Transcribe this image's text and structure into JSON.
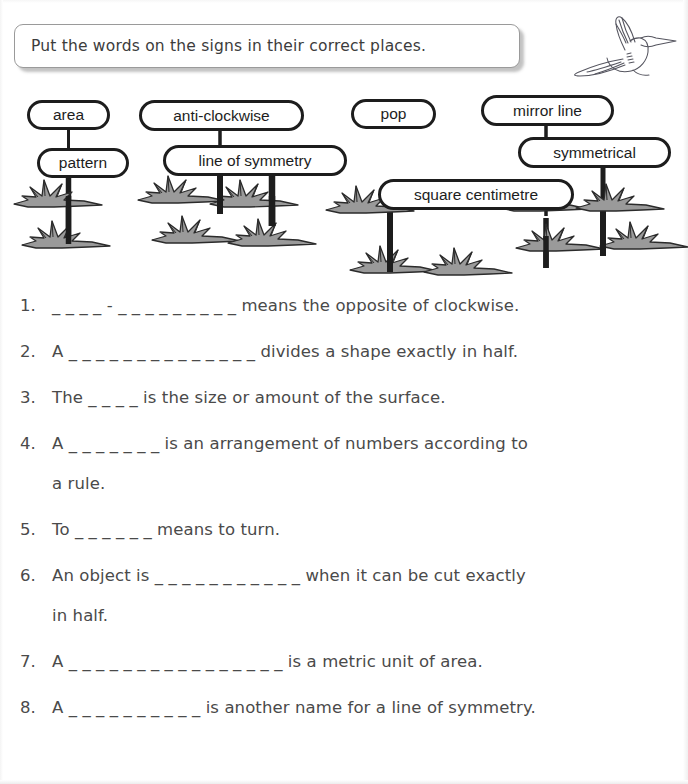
{
  "instruction": {
    "text": "Put the words on the signs in their correct places."
  },
  "decorations": {
    "bird_icon": "bird-flying-icon",
    "grass_icon": "grass-tuft-icon",
    "post_icon": "sign-post-icon"
  },
  "signs": [
    {
      "label": "area",
      "name": "sign-area"
    },
    {
      "label": "pattern",
      "name": "sign-pattern"
    },
    {
      "label": "anti-clockwise",
      "name": "sign-anti-clockwise"
    },
    {
      "label": "line of symmetry",
      "name": "sign-line-of-symmetry"
    },
    {
      "label": "pop",
      "name": "sign-pop"
    },
    {
      "label": "mirror line",
      "name": "sign-mirror-line"
    },
    {
      "label": "symmetrical",
      "name": "sign-symmetrical"
    },
    {
      "label": "square centimetre",
      "name": "sign-square-centimetre"
    }
  ],
  "questions": [
    {
      "number": "1.",
      "text": "_ _ _ _  -  _ _ _ _ _ _ _ _ _  means the opposite of clockwise.",
      "continuation": ""
    },
    {
      "number": "2.",
      "text": "A  _ _ _ _  _ _  _ _ _ _ _ _ _ _  divides a shape exactly in half.",
      "continuation": ""
    },
    {
      "number": "3.",
      "text": "The  _ _ _ _  is the size or amount of the surface.",
      "continuation": ""
    },
    {
      "number": "4.",
      "text": "A  _ _ _ _ _ _ _  is an arrangement of numbers according to",
      "continuation": "a rule."
    },
    {
      "number": "5.",
      "text": "To  _ _ _ _ _ _  means to turn.",
      "continuation": ""
    },
    {
      "number": "6.",
      "text": "An object is  _ _ _ _ _ _ _ _ _ _ _  when it can be cut exactly",
      "continuation": "in half."
    },
    {
      "number": "7.",
      "text": "A  _ _ _ _ _ _  _ _ _ _ _ _ _ _ _ _  is a metric unit of area.",
      "continuation": ""
    },
    {
      "number": "8.",
      "text": "A  _ _ _ _ _ _  _ _ _ _  is another name for a line of symmetry.",
      "continuation": ""
    }
  ],
  "colors": {
    "ink": "#4a4a4a",
    "sign_outline": "#1d1d1d",
    "grass_fill": "#9a9a9a",
    "grass_outline": "#2a2a2a",
    "banner_border": "#9a9a9a"
  }
}
